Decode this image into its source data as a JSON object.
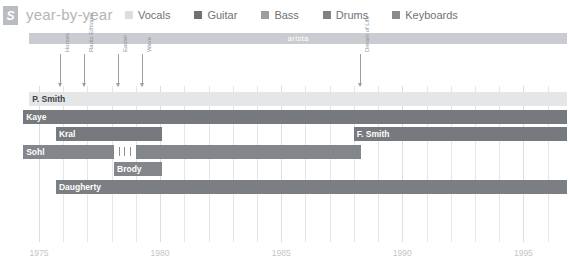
{
  "header": {
    "logo": "S",
    "logo_icon": "letter-s-badge-icon",
    "title": "year-by-year",
    "legend": [
      {
        "label": "Vocals",
        "color": "#dcdee0"
      },
      {
        "label": "Guitar",
        "color": "#6e7276"
      },
      {
        "label": "Bass",
        "color": "#9b9ea2"
      },
      {
        "label": "Drums",
        "color": "#7f8387"
      },
      {
        "label": "Keyboards",
        "color": "#878b8f"
      }
    ]
  },
  "chart_data": {
    "type": "timeline",
    "title": "year-by-year",
    "xlabel": "",
    "ylabel": "",
    "xlim": [
      1974.3,
      1996.8
    ],
    "grid": true,
    "legend_position": "top",
    "ticks": [
      "1975",
      "1980",
      "1985",
      "1990",
      "1995"
    ],
    "tick_values": [
      1975,
      1980,
      1985,
      1990,
      1995
    ],
    "labels_band": [
      {
        "label": "arista",
        "start": 1974.6,
        "end": 1996.8,
        "color": "#c9ccd0"
      }
    ],
    "markers": [
      {
        "label": "Horses",
        "year": 1975.85
      },
      {
        "label": "Radio Ethiopia",
        "year": 1976.85
      },
      {
        "label": "Easter",
        "year": 1978.25
      },
      {
        "label": "Wave",
        "year": 1979.25
      },
      {
        "label": "Dream of Life",
        "year": 1988.25
      }
    ],
    "rows": [
      {
        "name": "P. Smith",
        "role": "Vocals",
        "color": "#e4e6e8",
        "label_color": "dark",
        "segments": [
          {
            "start": 1974.6,
            "end": 1996.8
          }
        ]
      },
      {
        "name": "Kaye",
        "role": "Guitar",
        "color": "#76797d",
        "label_color": "light",
        "segments": [
          {
            "start": 1974.35,
            "end": 1996.8
          }
        ]
      },
      {
        "name": "Kral",
        "role": "Guitar",
        "color": "#76797d",
        "label_color": "light",
        "segments": [
          {
            "start": 1975.7,
            "end": 1980.1
          }
        ]
      },
      {
        "name": "F. Smith",
        "role": "Guitar",
        "color": "#76797d",
        "label_color": "light",
        "segments": [
          {
            "start": 1988.0,
            "end": 1996.8
          }
        ]
      },
      {
        "name": "Sohl",
        "role": "Keyboards",
        "color": "#83868a",
        "label_color": "light",
        "segments": [
          {
            "start": 1974.35,
            "end": 1978.1
          },
          {
            "start": 1979.0,
            "end": 1988.3
          }
        ]
      },
      {
        "name": "Brody",
        "role": "Keyboards",
        "color": "#83868a",
        "label_color": "light",
        "segments": [
          {
            "start": 1978.1,
            "end": 1980.1
          }
        ]
      },
      {
        "name": "Daugherty",
        "role": "Drums",
        "color": "#7b7e82",
        "label_color": "light",
        "segments": [
          {
            "start": 1975.7,
            "end": 1996.8
          }
        ]
      }
    ]
  }
}
